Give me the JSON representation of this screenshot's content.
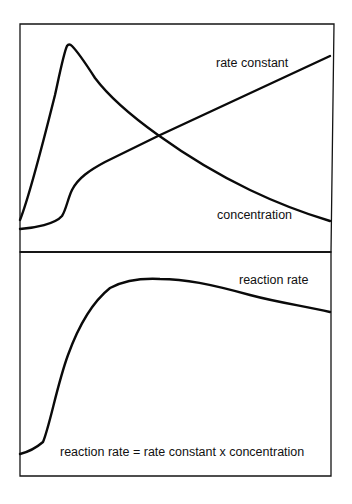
{
  "figure": {
    "type": "qualitative two-panel line diagram",
    "top_panel": {
      "curves": [
        {
          "name": "concentration",
          "label": "concentration",
          "description": "rises sharply to early peak, then decays",
          "points": [
            [
              20,
              220
            ],
            [
              35,
              170
            ],
            [
              50,
              110
            ],
            [
              62,
              62
            ],
            [
              69,
              45
            ],
            [
              76,
              50
            ],
            [
              90,
              72
            ],
            [
              110,
              98
            ],
            [
              130,
              112
            ],
            [
              158,
              135
            ],
            [
              200,
              162
            ],
            [
              250,
              190
            ],
            [
              290,
              208
            ],
            [
              330,
              221
            ]
          ]
        },
        {
          "name": "rate-constant",
          "label": "rate constant",
          "description": "low start, sigmoidal rise, then linear increase",
          "points": [
            [
              20,
              229
            ],
            [
              45,
              224
            ],
            [
              63,
              214
            ],
            [
              70,
              192
            ],
            [
              85,
              172
            ],
            [
              110,
              157
            ],
            [
              158,
              136
            ],
            [
              200,
              117
            ],
            [
              250,
              94
            ],
            [
              300,
              70
            ],
            [
              330,
              56
            ]
          ]
        }
      ]
    },
    "bottom_panel": {
      "curves": [
        {
          "name": "reaction-rate",
          "label": "reaction rate",
          "description": "sigmoidal rise to broad maximum then gradual decline",
          "points": [
            [
              20,
              454
            ],
            [
              35,
              448
            ],
            [
              43,
              442
            ],
            [
              55,
              400
            ],
            [
              70,
              350
            ],
            [
              90,
              310
            ],
            [
              110,
              287
            ],
            [
              130,
              281
            ],
            [
              160,
              279
            ],
            [
              200,
              282
            ],
            [
              250,
              295
            ],
            [
              290,
              303
            ],
            [
              330,
              312
            ]
          ]
        }
      ],
      "equation": "reaction rate = rate constant x concentration"
    }
  },
  "labels": {
    "rate_constant": "rate constant",
    "concentration": "concentration",
    "reaction_rate": "reaction rate",
    "equation": "reaction rate = rate constant x concentration"
  },
  "colors": {
    "line": "#0a0a0a",
    "frame": "#141414",
    "background": "#ffffff"
  }
}
